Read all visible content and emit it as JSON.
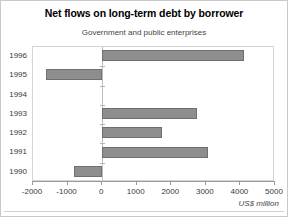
{
  "chart_data": {
    "type": "bar",
    "orientation": "horizontal",
    "title": "Net flows on long-term debt by borrower",
    "subtitle": "Government and public enterprises",
    "xlabel": "US$ million",
    "ylabel": "",
    "categories": [
      "1996",
      "1995",
      "1994",
      "1993",
      "1992",
      "1991",
      "1990"
    ],
    "values": [
      4100,
      -1620,
      0,
      2730,
      1730,
      3070,
      -810
    ],
    "xlim": [
      -2000,
      5000
    ],
    "xticks": [
      -2000,
      -1000,
      0,
      1000,
      2000,
      3000,
      4000,
      5000
    ],
    "xticklabels": [
      "-2000",
      "-1000",
      "0",
      "1000",
      "2000",
      "3000",
      "4000",
      "5000"
    ],
    "grid": false,
    "legend": null,
    "bar_color": "#8e8e8e",
    "bar_edge_color": "#6f6f6f"
  }
}
